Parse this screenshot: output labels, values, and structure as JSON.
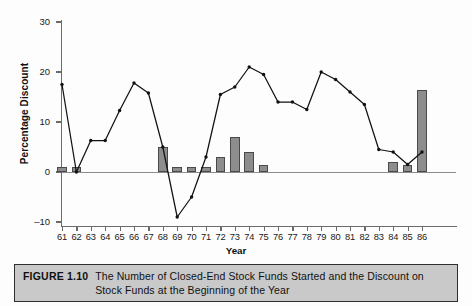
{
  "figure": {
    "label": "FIGURE 1.10",
    "caption": "The Number of Closed-End Stock Funds Started and the Discount on Stock Funds at the Beginning of the Year"
  },
  "chart_data": {
    "type": "bar",
    "title": "",
    "xlabel": "Year",
    "ylabel": "Percentage Discount",
    "ylim": [
      -10,
      30
    ],
    "yticks": [
      30,
      20,
      10,
      0,
      -10
    ],
    "ytick_labels": [
      "30",
      "20",
      "10",
      "0",
      "–10"
    ],
    "grid": false,
    "legend": "none",
    "categories": [
      "61",
      "62",
      "63",
      "64",
      "65",
      "66",
      "67",
      "68",
      "69",
      "70",
      "71",
      "72",
      "73",
      "74",
      "75",
      "76",
      "77",
      "78",
      "79",
      "80",
      "81",
      "82",
      "83",
      "84",
      "85",
      "86"
    ],
    "series": [
      {
        "name": "Number of Closed-End Stock Funds Started",
        "type": "bar",
        "values": [
          1,
          1,
          0,
          0,
          0,
          0,
          0,
          5,
          1,
          1,
          1,
          3,
          7,
          4,
          1.5,
          0,
          0,
          0,
          0,
          0,
          0,
          0,
          0,
          2,
          1.5,
          16.5
        ]
      },
      {
        "name": "Percentage Discount",
        "type": "line",
        "values": [
          17.5,
          0,
          6.3,
          6.3,
          12.3,
          17.8,
          15.8,
          5,
          -9,
          -5,
          3,
          15.5,
          17,
          21,
          19.5,
          14,
          14,
          12.5,
          20,
          18.5,
          16,
          13.5,
          4.5,
          4,
          1.5,
          4
        ]
      }
    ],
    "colors": {
      "bar_fill": "#8d8d8d",
      "bar_stroke": "#4a4a4a",
      "line": "#111111",
      "axis": "#6b6b6b",
      "caption_band": "#c9c9c9"
    }
  }
}
